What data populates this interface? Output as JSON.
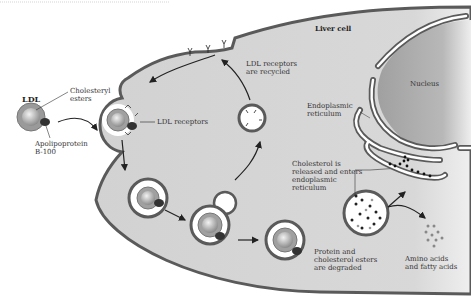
{
  "diagram": {
    "labels": {
      "ldl": "LDL",
      "cholesteryl_esters": "Cholesteryl\nesters",
      "apolipoprotein": "Apolipoprotein\nB-100",
      "liver_cell": "Liver cell",
      "nucleus": "Nucleus",
      "ldl_receptors": "LDL receptors",
      "receptors_recycled": "LDL receptors\nare recycled",
      "endoplasmic_reticulum": "Endoplasmic\nreticulum",
      "cholesterol_released": "Cholesterol is\nreleased and enters\nendoplasmic\nreticulum",
      "protein_degraded": "Protein and\ncholesterol esters\nare degraded",
      "amino_acids": "Amino acids\nand fatty acids"
    },
    "colors": {
      "cell_fill": "#d4d4d4",
      "membrane": "#5a5a5a",
      "nucleus_fill": "#a8a8a8",
      "ldl_outer": "#9a9a9a",
      "ldl_core": "#c8c8c8",
      "apoprotein": "#333333"
    }
  }
}
